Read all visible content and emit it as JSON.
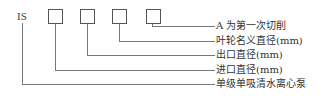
{
  "diagram": {
    "prefix": "IS",
    "boxes": [
      "",
      "",
      "",
      ""
    ],
    "labels": [
      "A 为第一次切削",
      "叶轮名义直径(mm)",
      "出口直径(mm)",
      "进口直径(mm)",
      "单级单吸清水离心泵"
    ],
    "line_color": "#777777",
    "text_color": "#333333"
  }
}
